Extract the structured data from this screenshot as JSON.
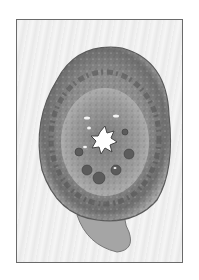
{
  "image": {
    "subject": "histological cross-section specimen",
    "style": "grayscale",
    "colors": {
      "frame_border": "#6a6a6a",
      "background": "#f0f0f0",
      "tissue_light": "#b8b8b8",
      "tissue_mid": "#8a8a8a",
      "tissue_dark": "#4a4a4a",
      "lumen": "#ffffff"
    }
  }
}
